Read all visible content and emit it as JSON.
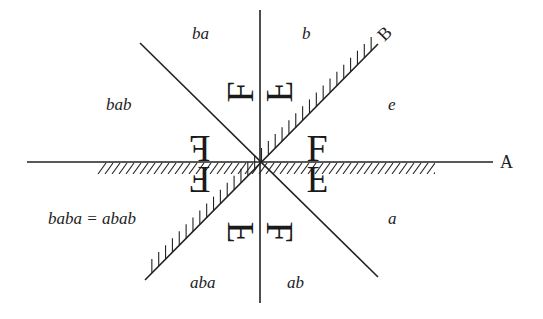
{
  "diagram": {
    "mirrors": {
      "A": {
        "label": "A"
      },
      "B": {
        "label": "B"
      }
    },
    "regions": {
      "e": {
        "label": "e"
      },
      "a": {
        "label": "a"
      },
      "b": {
        "label": "b"
      },
      "ab": {
        "label": "ab"
      },
      "ba": {
        "label": "ba"
      },
      "aba": {
        "label": "aba"
      },
      "bab": {
        "label": "bab"
      },
      "baba": {
        "label": "baba = abab"
      }
    },
    "glyph": {
      "char": "F"
    },
    "colors": {
      "ink": "#222222",
      "background": "#ffffff"
    }
  }
}
